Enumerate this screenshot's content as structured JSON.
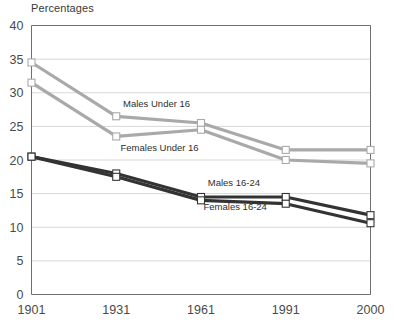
{
  "chart": {
    "title": "Percentages"
  },
  "chart_data": {
    "type": "line",
    "title": "Percentages",
    "xlabel": "",
    "ylabel": "Percentages",
    "grid": true,
    "legend_position": "inline-labels",
    "x": [
      "1901",
      "1931",
      "1961",
      "1991",
      "2000"
    ],
    "xlim": [
      0,
      4
    ],
    "ylim": [
      0,
      40
    ],
    "yticks": [
      "0",
      "5",
      "10",
      "15",
      "20",
      "25",
      "30",
      "35",
      "40"
    ],
    "xticks": [
      "1901",
      "1931",
      "1961",
      "1991",
      "2000"
    ],
    "series": [
      {
        "name": "Males Under 16",
        "color": "#a9a9a9",
        "values": [
          34.5,
          26.5,
          25.5,
          21.5,
          21.5
        ]
      },
      {
        "name": "Females Under 16",
        "color": "#a9a9a9",
        "values": [
          31.5,
          23.5,
          24.5,
          20.0,
          19.5
        ]
      },
      {
        "name": "Males 16-24",
        "color": "#333333",
        "values": [
          20.5,
          18.0,
          14.5,
          14.5,
          11.8
        ]
      },
      {
        "name": "Females 16-24",
        "color": "#333333",
        "values": [
          20.5,
          17.5,
          14.0,
          13.5,
          10.6
        ]
      }
    ],
    "annotations": [
      {
        "text": "Males Under 16",
        "x": 1.08,
        "y": 27.9
      },
      {
        "text": "Females Under 16",
        "x": 1.05,
        "y": 21.4
      },
      {
        "text": "Males 16-24",
        "x": 2.08,
        "y": 16.2
      },
      {
        "text": "Females 16-24",
        "x": 2.03,
        "y": 12.5
      }
    ],
    "colors": {
      "under16": "#a9a9a9",
      "age16to24": "#333333",
      "grid": "#d8d8d8",
      "axis": "#6f6f6f",
      "marker_fill": "#ffffff"
    }
  }
}
